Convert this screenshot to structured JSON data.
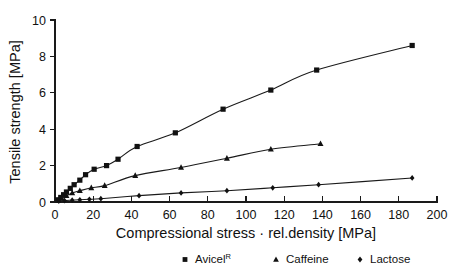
{
  "chart_data": {
    "type": "scatter",
    "title": "",
    "xlabel": "Compressional stress · rel.density [MPa]",
    "ylabel": "Tensile strength [MPa]",
    "xlim": [
      0,
      200
    ],
    "ylim": [
      0,
      10
    ],
    "xticks": [
      0,
      20,
      40,
      60,
      80,
      100,
      120,
      140,
      160,
      180,
      200
    ],
    "yticks": [
      0,
      2,
      4,
      6,
      8,
      10
    ],
    "xticklabels": [
      "0",
      "20",
      "40",
      "60",
      "80",
      "100",
      "120",
      "140",
      "160",
      "180",
      "200"
    ],
    "yticklabels": [
      "0",
      "2",
      "4",
      "6",
      "8",
      "10"
    ],
    "grid": false,
    "legend_position": "below",
    "series": [
      {
        "name": "Avicel",
        "name_superscript": "R",
        "marker": "square",
        "color": "#111111",
        "points": [
          {
            "x": 1.5,
            "y": 0.12
          },
          {
            "x": 3.0,
            "y": 0.25
          },
          {
            "x": 4.5,
            "y": 0.4
          },
          {
            "x": 6.0,
            "y": 0.55
          },
          {
            "x": 8.0,
            "y": 0.75
          },
          {
            "x": 10.0,
            "y": 0.95
          },
          {
            "x": 13.0,
            "y": 1.2
          },
          {
            "x": 16.0,
            "y": 1.5
          },
          {
            "x": 20.5,
            "y": 1.8
          },
          {
            "x": 27.0,
            "y": 2.0
          },
          {
            "x": 33.0,
            "y": 2.35
          },
          {
            "x": 43.0,
            "y": 3.05
          },
          {
            "x": 63.0,
            "y": 3.8
          },
          {
            "x": 88.0,
            "y": 5.1
          },
          {
            "x": 113.0,
            "y": 6.15
          },
          {
            "x": 137.0,
            "y": 7.25
          },
          {
            "x": 187.0,
            "y": 8.6
          }
        ]
      },
      {
        "name": "Caffeine",
        "name_superscript": "",
        "marker": "triangle",
        "color": "#111111",
        "points": [
          {
            "x": 1.5,
            "y": 0.08
          },
          {
            "x": 3.5,
            "y": 0.2
          },
          {
            "x": 6.0,
            "y": 0.35
          },
          {
            "x": 9.0,
            "y": 0.5
          },
          {
            "x": 13.0,
            "y": 0.62
          },
          {
            "x": 19.0,
            "y": 0.78
          },
          {
            "x": 26.0,
            "y": 0.9
          },
          {
            "x": 42.0,
            "y": 1.45
          },
          {
            "x": 66.0,
            "y": 1.9
          },
          {
            "x": 90.0,
            "y": 2.4
          },
          {
            "x": 113.0,
            "y": 2.9
          },
          {
            "x": 139.0,
            "y": 3.2
          }
        ]
      },
      {
        "name": "Lactose",
        "name_superscript": "",
        "marker": "diamond",
        "color": "#111111",
        "points": [
          {
            "x": 2.0,
            "y": 0.05
          },
          {
            "x": 5.0,
            "y": 0.08
          },
          {
            "x": 9.0,
            "y": 0.1
          },
          {
            "x": 13.0,
            "y": 0.12
          },
          {
            "x": 18.0,
            "y": 0.15
          },
          {
            "x": 24.0,
            "y": 0.18
          },
          {
            "x": 44.0,
            "y": 0.35
          },
          {
            "x": 66.0,
            "y": 0.5
          },
          {
            "x": 90.0,
            "y": 0.62
          },
          {
            "x": 114.0,
            "y": 0.78
          },
          {
            "x": 138.0,
            "y": 0.95
          },
          {
            "x": 187.0,
            "y": 1.32
          }
        ]
      }
    ],
    "legend": [
      {
        "marker": "square",
        "label": "Avicel",
        "superscript": "R"
      },
      {
        "marker": "triangle",
        "label": "Caffeine",
        "superscript": ""
      },
      {
        "marker": "diamond",
        "label": "Lactose",
        "superscript": ""
      }
    ]
  }
}
